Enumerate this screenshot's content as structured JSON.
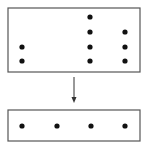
{
  "diagram": {
    "top_box": {
      "x": 8,
      "y": 8,
      "w": 132,
      "h": 64,
      "dots": [
        {
          "x": 22,
          "y": 47
        },
        {
          "x": 22,
          "y": 61
        },
        {
          "x": 90,
          "y": 17
        },
        {
          "x": 90,
          "y": 32
        },
        {
          "x": 90,
          "y": 47
        },
        {
          "x": 90,
          "y": 61
        },
        {
          "x": 125,
          "y": 32
        },
        {
          "x": 125,
          "y": 47
        },
        {
          "x": 125,
          "y": 61
        }
      ]
    },
    "arrow": {
      "x": 74,
      "y1": 77,
      "y2": 103
    },
    "bottom_box": {
      "x": 8,
      "y": 110,
      "w": 132,
      "h": 31,
      "dots": [
        {
          "x": 22,
          "y": 126
        },
        {
          "x": 57,
          "y": 126
        },
        {
          "x": 91,
          "y": 126
        },
        {
          "x": 125,
          "y": 126
        }
      ]
    },
    "colors": {
      "stroke": "#555555",
      "dot": "#111111"
    }
  }
}
